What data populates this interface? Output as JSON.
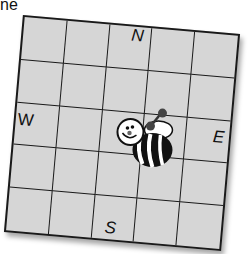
{
  "header": {
    "cropped_text": "ne"
  },
  "grid": {
    "rows": 5,
    "cols": 5,
    "fill_color": "#d6d6d6",
    "line_color": "#1a1a1a"
  },
  "compass": {
    "north": "N",
    "south": "S",
    "east": "E",
    "west": "W"
  },
  "bee": {
    "icon": "bee-icon",
    "row": 3,
    "col": 4
  }
}
